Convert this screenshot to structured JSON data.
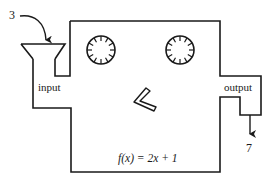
{
  "diagram": {
    "input_value": "3",
    "input_label": "input",
    "output_label": "output",
    "output_value": "7",
    "function": {
      "name": "f",
      "variable": "x",
      "rule": "2x + 1",
      "text": "f(x) = 2x + 1"
    },
    "elements": [
      "input funnel",
      "machine box",
      "two gear dials",
      "chevron lever",
      "output chute"
    ],
    "colors": {
      "stroke": "#1a1a1a",
      "background": "#ffffff"
    }
  }
}
